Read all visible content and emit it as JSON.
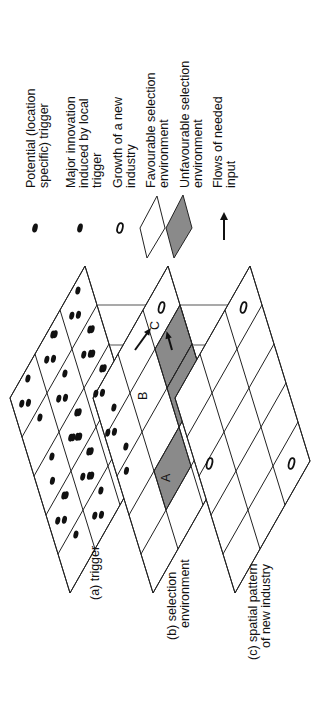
{
  "legend": {
    "items": [
      {
        "symbol": "filled-dot",
        "label_lines": [
          "Potential (location",
          "specific) trigger"
        ]
      },
      {
        "symbol": "filled-dot",
        "label_lines": [
          "Major innovation",
          "induced by local",
          "trigger"
        ]
      },
      {
        "symbol": "open-ellipse",
        "label_lines": [
          "Growth of a new",
          "industry"
        ]
      },
      {
        "symbol": "white-rhombus",
        "label_lines": [
          "Favourable selection",
          "environment"
        ]
      },
      {
        "symbol": "grey-rhombus",
        "label_lines": [
          "Unfavourable selection",
          "environment"
        ]
      },
      {
        "symbol": "arrow",
        "label_lines": [
          "Flows of needed",
          "input"
        ]
      }
    ]
  },
  "layers": [
    {
      "id": "a",
      "label_lines": [
        "(a) trigger"
      ]
    },
    {
      "id": "b",
      "label_lines": [
        "(b) selection",
        "environment"
      ]
    },
    {
      "id": "c",
      "label_lines": [
        "(c) spatial pattern",
        "of new industry"
      ]
    }
  ],
  "cell_labels": {
    "A": "A",
    "B": "B",
    "C": "C"
  },
  "colors": {
    "unfavourable_fill": "#8a8a8a",
    "favourable_fill": "#ffffff",
    "line": "#222222"
  }
}
